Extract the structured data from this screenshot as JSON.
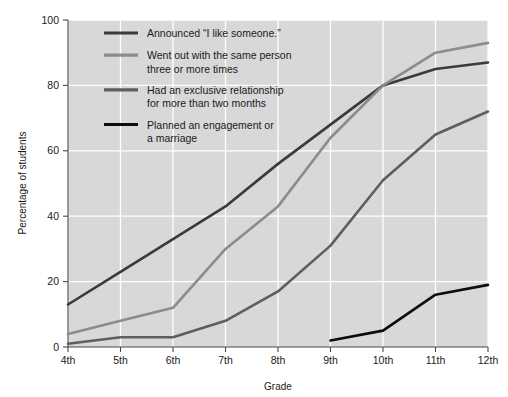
{
  "chart_data": {
    "type": "line",
    "title": "",
    "xlabel": "Grade",
    "ylabel": "Percentage of students",
    "categories": [
      "4th",
      "5th",
      "6th",
      "7th",
      "8th",
      "9th",
      "10th",
      "11th",
      "12th"
    ],
    "xlim": [
      0,
      8
    ],
    "ylim": [
      0,
      100
    ],
    "yticks": [
      0,
      20,
      40,
      60,
      80,
      100
    ],
    "grid": true,
    "legend_position": "top-left-inside",
    "series": [
      {
        "name": "Announced “I like someone.”",
        "color": "#3a3a3a",
        "values": [
          13,
          23,
          33,
          43,
          56,
          68,
          80,
          85,
          87
        ]
      },
      {
        "name": "Went out with the same person three or more times",
        "color": "#8c8c8c",
        "values": [
          4,
          8,
          12,
          30,
          43,
          64,
          80,
          90,
          93
        ]
      },
      {
        "name": "Had an exclusive relationship for more than two months",
        "color": "#5e5e5e",
        "values": [
          1,
          3,
          3,
          8,
          17,
          31,
          51,
          65,
          72
        ]
      },
      {
        "name": "Planned an engagement or a marriage",
        "color": "#0d0d0d",
        "values": [
          null,
          null,
          null,
          null,
          null,
          2,
          5,
          16,
          19
        ]
      }
    ]
  },
  "axes": {
    "ylabel": "Percentage of students",
    "xlabel": "Grade",
    "ytick_labels": [
      "0",
      "20",
      "40",
      "60",
      "80",
      "100"
    ],
    "xtick_labels": [
      "4th",
      "5th",
      "6th",
      "7th",
      "8th",
      "9th",
      "10th",
      "11th",
      "12th"
    ]
  },
  "legend": {
    "items": [
      {
        "label_line1": "Announced “I like someone.”",
        "label_line2": "",
        "color": "#3a3a3a"
      },
      {
        "label_line1": "Went out with the same person",
        "label_line2": "three or more times",
        "color": "#8c8c8c"
      },
      {
        "label_line1": "Had an exclusive relationship",
        "label_line2": "for more than two months",
        "color": "#5e5e5e"
      },
      {
        "label_line1": "Planned an engagement or",
        "label_line2": "a marriage",
        "color": "#0d0d0d"
      }
    ]
  },
  "style": {
    "plot_background": "#d8d8d8",
    "grid_color": "#ffffff",
    "axis_color": "#4a4a4a",
    "page_background": "#ffffff"
  }
}
